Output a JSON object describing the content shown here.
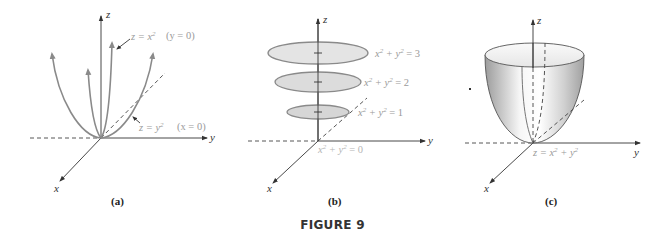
{
  "figure": {
    "title": "FIGURE 9",
    "panels": [
      {
        "id": "a",
        "caption": "(a)",
        "axes": {
          "x": "x",
          "y": "y",
          "z": "z"
        },
        "annotations": [
          {
            "equation": "z = x",
            "exponent": "2",
            "condition": "(y = 0)"
          },
          {
            "equation": "z = y",
            "exponent": "2",
            "condition": "(x = 0)"
          }
        ],
        "description": "Traces of paraboloid: parabolas in planes through the z-axis"
      },
      {
        "id": "b",
        "caption": "(b)",
        "axes": {
          "x": "x",
          "y": "y",
          "z": "z"
        },
        "level_curves": [
          {
            "lhs": "x",
            "lhs_exp": "2",
            "mid": " + y",
            "mid_exp": "2",
            "rhs": " = 3"
          },
          {
            "lhs": "x",
            "lhs_exp": "2",
            "mid": " + y",
            "mid_exp": "2",
            "rhs": " = 2"
          },
          {
            "lhs": "x",
            "lhs_exp": "2",
            "mid": " + y",
            "mid_exp": "2",
            "rhs": " = 1"
          },
          {
            "lhs": "x",
            "lhs_exp": "2",
            "mid": " + y",
            "mid_exp": "2",
            "rhs": " = 0"
          }
        ],
        "description": "Horizontal cross-sections are circles"
      },
      {
        "id": "c",
        "caption": "(c)",
        "axes": {
          "x": "x",
          "y": "y",
          "z": "z"
        },
        "surface_label": {
          "lhs": "z = x",
          "lhs_exp": "2",
          "mid": " + y",
          "mid_exp": "2"
        },
        "description": "Paraboloid surface z = x^2 + y^2"
      }
    ],
    "colors": {
      "axis": "#333333",
      "curve": "#8a8a8a",
      "label_gray": "#9a9a9a",
      "disc_fill": "#e2e2e2",
      "surface_light": "#f4f4f4",
      "surface_dark": "#a8a8a8"
    }
  }
}
